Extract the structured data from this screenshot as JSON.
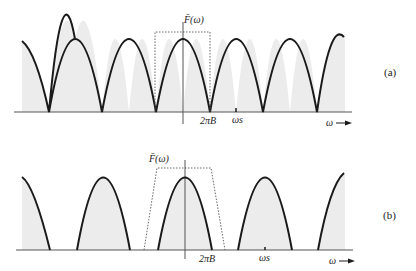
{
  "figure": {
    "panels": [
      {
        "id": "a",
        "panel_label": "(a)",
        "axis_label": "F̄(ω)",
        "tick_2piB": "2πB",
        "tick_ws": "ωs",
        "x_axis_label": "ω",
        "description": "Spectrum of sampled signal with sampling at Nyquist rate: adjacent replicas touch at 2πB; dotted ideal lowpass filter of width ±2πB"
      },
      {
        "id": "b",
        "panel_label": "(b)",
        "axis_label": "F̄(ω)",
        "tick_2piB": "2πB",
        "tick_ws": "ωs",
        "x_axis_label": "ω",
        "description": "Spectrum of sampled signal with oversampling: gaps between replicas; dotted practical filter with gradual cutoff"
      }
    ],
    "colors": {
      "curve": "#1a1a1a",
      "fill": "#ececec",
      "axis": "#555555",
      "filter": "#555555"
    }
  }
}
